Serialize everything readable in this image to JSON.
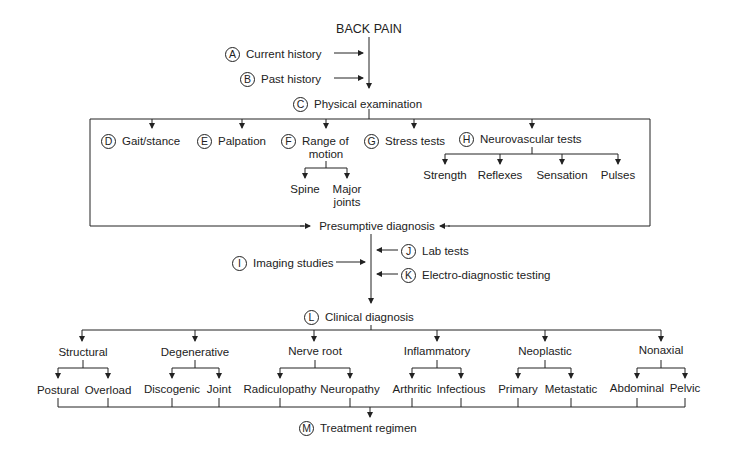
{
  "title": "BACK PAIN",
  "steps": {
    "A": {
      "letter": "A",
      "label": "Current history"
    },
    "B": {
      "letter": "B",
      "label": "Past history"
    },
    "C": {
      "letter": "C",
      "label": "Physical examination"
    },
    "D": {
      "letter": "D",
      "label": "Gait/stance"
    },
    "E": {
      "letter": "E",
      "label": "Palpation"
    },
    "F": {
      "letter": "F",
      "label": "Range of",
      "label2": "motion"
    },
    "G": {
      "letter": "G",
      "label": "Stress tests"
    },
    "H": {
      "letter": "H",
      "label": "Neurovascular tests"
    },
    "I": {
      "letter": "I",
      "label": "Imaging studies"
    },
    "J": {
      "letter": "J",
      "label": "Lab tests"
    },
    "K": {
      "letter": "K",
      "label": "Electro-diagnostic testing"
    },
    "L": {
      "letter": "L",
      "label": "Clinical diagnosis"
    },
    "M": {
      "letter": "M",
      "label": "Treatment regimen"
    }
  },
  "rom_children": [
    "Spine",
    "Major",
    "joints"
  ],
  "neuro_children": [
    "Strength",
    "Reflexes",
    "Sensation",
    "Pulses"
  ],
  "presumptive": "Presumptive diagnosis",
  "categories": [
    {
      "name": "Structural",
      "children": [
        "Postural",
        "Overload"
      ]
    },
    {
      "name": "Degenerative",
      "children": [
        "Discogenic",
        "Joint"
      ]
    },
    {
      "name": "Nerve root",
      "children": [
        "Radiculopathy",
        "Neuropathy"
      ]
    },
    {
      "name": "Inflammatory",
      "children": [
        "Arthritic",
        "Infectious"
      ]
    },
    {
      "name": "Neoplastic",
      "children": [
        "Primary",
        "Metastatic"
      ]
    },
    {
      "name": "Nonaxial",
      "children": [
        "Abdominal",
        "Pelvic"
      ]
    }
  ]
}
